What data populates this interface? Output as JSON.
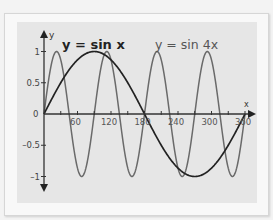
{
  "chart_data": {
    "type": "line",
    "title": "",
    "xlabel": "x",
    "ylabel": "y",
    "xlim": [
      0,
      360
    ],
    "ylim": [
      -1,
      1
    ],
    "x_ticks": [
      30,
      60,
      90,
      120,
      150,
      180,
      210,
      240,
      270,
      300,
      330,
      360
    ],
    "x_tick_labels": [
      "60",
      "120",
      "180",
      "240",
      "300",
      "360"
    ],
    "x_tick_label_values": [
      60,
      120,
      180,
      240,
      300,
      360
    ],
    "y_ticks": [
      1,
      0.5,
      0,
      -0.5,
      -1
    ],
    "y_tick_labels": [
      "1",
      "0.5",
      "0",
      "-0.5",
      "-1"
    ],
    "grid": false,
    "series": [
      {
        "name": "y = sin x",
        "color": "#222222",
        "x": [
          0,
          30,
          60,
          90,
          120,
          150,
          180,
          210,
          240,
          270,
          300,
          330,
          360
        ],
        "values": [
          0,
          0.5,
          0.866,
          1,
          0.866,
          0.5,
          0,
          -0.5,
          -0.866,
          -1,
          -0.866,
          -0.5,
          0
        ]
      },
      {
        "name": "y = sin 4x",
        "color": "#6a6a6a",
        "x": [
          0,
          22.5,
          45,
          67.5,
          90,
          112.5,
          135,
          157.5,
          180,
          202.5,
          225,
          247.5,
          270,
          292.5,
          315,
          337.5,
          360
        ],
        "values": [
          0,
          1,
          0,
          -1,
          0,
          1,
          0,
          -1,
          0,
          1,
          0,
          -1,
          0,
          1,
          0,
          -1,
          0
        ]
      }
    ],
    "annotations": [
      {
        "text": "y = sin x",
        "near_x": 75
      },
      {
        "text": "y = sin 4x",
        "near_x": 240
      }
    ]
  },
  "labels": {
    "sinx": "y = sin x",
    "sin4x": "y = sin 4x",
    "x_axis": "x",
    "y_axis": "y",
    "origin": "0"
  }
}
